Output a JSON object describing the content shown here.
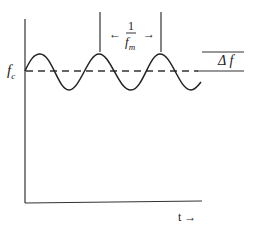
{
  "diagram": {
    "title": "",
    "labels": {
      "carrier_freq": "f",
      "carrier_sub": "c",
      "time_axis": "t →",
      "deviation": "Δ f",
      "period_left_arrow": "←",
      "period_right_arrow": "→",
      "period_num": "1",
      "period_den": "f",
      "period_den_sub": "m"
    },
    "colors": {
      "line": "#222222",
      "background": "#ffffff"
    }
  }
}
